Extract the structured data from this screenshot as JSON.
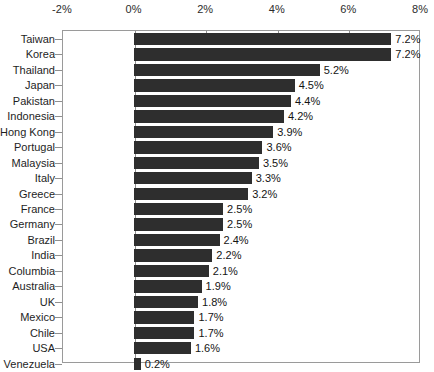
{
  "chart_data": {
    "type": "bar",
    "orientation": "horizontal",
    "title": "",
    "subtitle": "",
    "xlabel": "",
    "ylabel": "",
    "xlim": [
      -2,
      8
    ],
    "xticks": [
      -2,
      0,
      2,
      4,
      6,
      8
    ],
    "xtick_labels": [
      "-2%",
      "0%",
      "2%",
      "4%",
      "6%",
      "8%"
    ],
    "grid": false,
    "legend": null,
    "value_label_suffix": "%",
    "bar_color": "#2e2e2e",
    "axis_color": "#8f8f8f",
    "background_color": "#ffffff",
    "categories": [
      "Taiwan",
      "Korea",
      "Thailand",
      "Japan",
      "Pakistan",
      "Indonesia",
      "Hong Kong",
      "Portugal",
      "Malaysia",
      "Italy",
      "Greece",
      "France",
      "Germany",
      "Brazil",
      "India",
      "Columbia",
      "Australia",
      "UK",
      "Mexico",
      "Chile",
      "USA",
      "Venezuela"
    ],
    "values": [
      7.2,
      7.2,
      5.2,
      4.5,
      4.4,
      4.2,
      3.9,
      3.6,
      3.5,
      3.3,
      3.2,
      2.5,
      2.5,
      2.4,
      2.2,
      2.1,
      1.9,
      1.8,
      1.7,
      1.7,
      1.6,
      0.2
    ],
    "value_labels": [
      "7.2%",
      "7.2%",
      "5.2%",
      "4.5%",
      "4.4%",
      "4.2%",
      "3.9%",
      "3.6%",
      "3.5%",
      "3.3%",
      "3.2%",
      "2.5%",
      "2.5%",
      "2.4%",
      "2.2%",
      "2.1%",
      "1.9%",
      "1.8%",
      "1.7%",
      "1.7%",
      "1.6%",
      "0.2%"
    ]
  }
}
